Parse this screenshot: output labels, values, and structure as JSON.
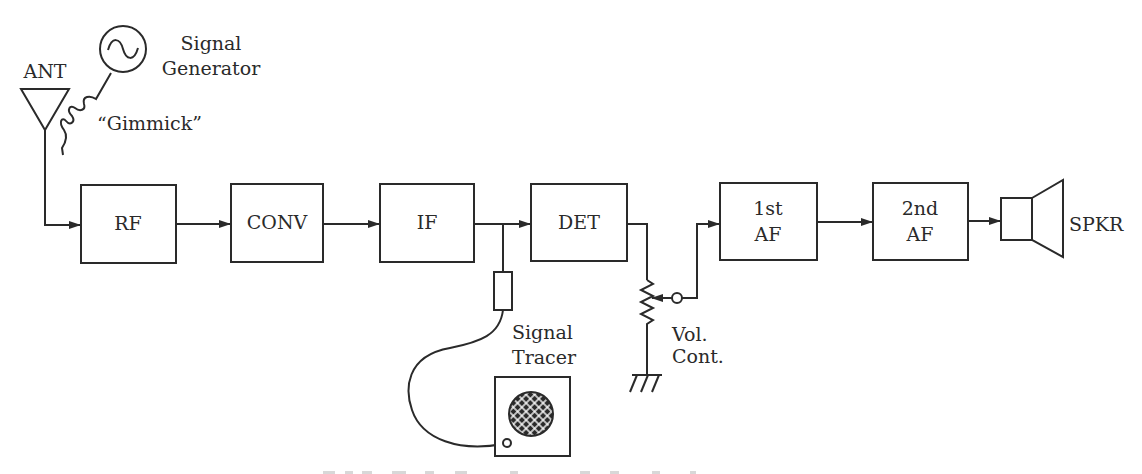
{
  "diagram": {
    "antenna": {
      "label": "ANT"
    },
    "signal_generator": {
      "line1": "Signal",
      "line2": "Generator"
    },
    "gimmick": {
      "label": "“Gimmick”"
    },
    "blocks": [
      {
        "id": "rf",
        "line1": "RF",
        "line2": ""
      },
      {
        "id": "conv",
        "line1": "CONV",
        "line2": ""
      },
      {
        "id": "if",
        "line1": "IF",
        "line2": ""
      },
      {
        "id": "det",
        "line1": "DET",
        "line2": ""
      },
      {
        "id": "af1",
        "line1": "1st",
        "line2": "AF"
      },
      {
        "id": "af2",
        "line1": "2nd",
        "line2": "AF"
      }
    ],
    "speaker": {
      "label": "SPKR"
    },
    "volume_control": {
      "line1": "Vol.",
      "line2": "Cont."
    },
    "signal_tracer": {
      "line1": "Signal",
      "line2": "Tracer"
    },
    "colors": {
      "ink": "#2a2a2a",
      "background": "#ffffff"
    }
  }
}
